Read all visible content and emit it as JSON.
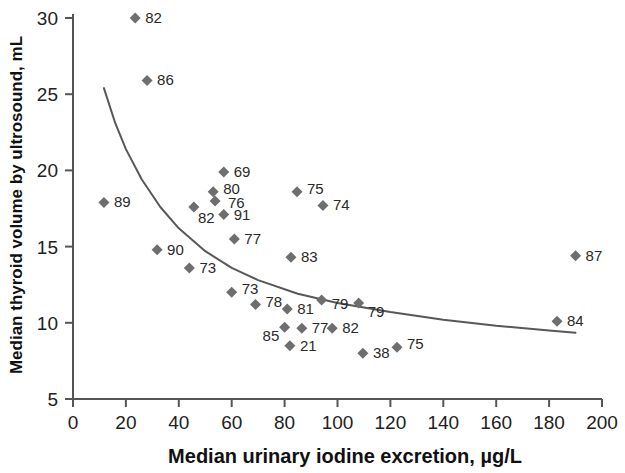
{
  "chart_data": {
    "type": "scatter",
    "title": "",
    "xlabel": "Median urinary iodine excretion, µg/L",
    "ylabel": "Median thyroid volume by ultrosound, mL",
    "xlim": [
      0,
      200
    ],
    "ylim": [
      5,
      31
    ],
    "xticks": [
      0,
      20,
      40,
      60,
      80,
      100,
      120,
      140,
      160,
      180,
      200
    ],
    "yticks": [
      5,
      10,
      15,
      20,
      25,
      30
    ],
    "grid": false,
    "legend": "none",
    "marker": "diamond",
    "marker_color": "#6e6e6e",
    "curve_color": "#585858",
    "axis_color": "#555555",
    "points": [
      {
        "label": "82",
        "x": 23.5,
        "y": 30.0,
        "lx": 10,
        "ly": 5
      },
      {
        "label": "86",
        "x": 28.0,
        "y": 25.9,
        "lx": 10,
        "ly": 5
      },
      {
        "label": "89",
        "x": 11.7,
        "y": 17.9,
        "lx": 10,
        "ly": 5
      },
      {
        "label": "69",
        "x": 57.0,
        "y": 19.9,
        "lx": 10,
        "ly": 5
      },
      {
        "label": "80",
        "x": 53.0,
        "y": 18.6,
        "lx": 10,
        "ly": 2
      },
      {
        "label": "76",
        "x": 53.7,
        "y": 18.0,
        "lx": 13,
        "ly": 7
      },
      {
        "label": "82",
        "x": 45.7,
        "y": 17.6,
        "lx": 4,
        "ly": 16
      },
      {
        "label": "91",
        "x": 57.0,
        "y": 17.1,
        "lx": 10,
        "ly": 5
      },
      {
        "label": "77",
        "x": 61.0,
        "y": 15.5,
        "lx": 10,
        "ly": 5
      },
      {
        "label": "75",
        "x": 84.7,
        "y": 18.6,
        "lx": 10,
        "ly": 2
      },
      {
        "label": "74",
        "x": 94.5,
        "y": 17.7,
        "lx": 10,
        "ly": 5
      },
      {
        "label": "90",
        "x": 31.8,
        "y": 14.8,
        "lx": 10,
        "ly": 5
      },
      {
        "label": "73",
        "x": 44.0,
        "y": 13.6,
        "lx": 10,
        "ly": 5
      },
      {
        "label": "83",
        "x": 82.4,
        "y": 14.3,
        "lx": 10,
        "ly": 5
      },
      {
        "label": "87",
        "x": 190.0,
        "y": 14.4,
        "lx": 10,
        "ly": 5
      },
      {
        "label": "73",
        "x": 60.0,
        "y": 12.0,
        "lx": 10,
        "ly": 2
      },
      {
        "label": "78",
        "x": 69.0,
        "y": 11.2,
        "lx": 10,
        "ly": 2
      },
      {
        "label": "81",
        "x": 81.0,
        "y": 10.9,
        "lx": 10,
        "ly": 5
      },
      {
        "label": "79",
        "x": 94.0,
        "y": 11.5,
        "lx": 10,
        "ly": 9
      },
      {
        "label": "79",
        "x": 108.0,
        "y": 11.3,
        "lx": 9,
        "ly": 14
      },
      {
        "label": "85",
        "x": 80.0,
        "y": 9.7,
        "lx": -22,
        "ly": 14
      },
      {
        "label": "77",
        "x": 86.5,
        "y": 9.65,
        "lx": 10,
        "ly": 5
      },
      {
        "label": "82",
        "x": 98.0,
        "y": 9.65,
        "lx": 10,
        "ly": 5
      },
      {
        "label": "84",
        "x": 183.0,
        "y": 10.1,
        "lx": 10,
        "ly": 5
      },
      {
        "label": "21",
        "x": 82.0,
        "y": 8.5,
        "lx": 10,
        "ly": 5
      },
      {
        "label": "38",
        "x": 109.6,
        "y": 8.0,
        "lx": 10,
        "ly": 5
      },
      {
        "label": "75",
        "x": 122.5,
        "y": 8.4,
        "lx": 10,
        "ly": 2
      }
    ],
    "trend_curve": {
      "description": "decreasing power/inverse fit curve",
      "points": [
        {
          "x": 11.7,
          "y": 25.4
        },
        {
          "x": 16.0,
          "y": 23.1
        },
        {
          "x": 20.0,
          "y": 21.4
        },
        {
          "x": 26.0,
          "y": 19.4
        },
        {
          "x": 33.0,
          "y": 17.6
        },
        {
          "x": 40.0,
          "y": 16.2
        },
        {
          "x": 50.0,
          "y": 14.7
        },
        {
          "x": 60.0,
          "y": 13.6
        },
        {
          "x": 70.0,
          "y": 12.8
        },
        {
          "x": 85.0,
          "y": 11.9
        },
        {
          "x": 100.0,
          "y": 11.3
        },
        {
          "x": 120.0,
          "y": 10.7
        },
        {
          "x": 140.0,
          "y": 10.2
        },
        {
          "x": 160.0,
          "y": 9.8
        },
        {
          "x": 180.0,
          "y": 9.5
        },
        {
          "x": 190.0,
          "y": 9.35
        }
      ]
    }
  }
}
